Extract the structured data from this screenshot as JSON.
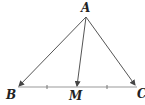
{
  "diagram": {
    "type": "triangle-with-median",
    "points": {
      "A": {
        "label": "A",
        "x": 86,
        "y": 17
      },
      "B": {
        "label": "B",
        "x": 18,
        "y": 87
      },
      "C": {
        "label": "C",
        "x": 137,
        "y": 87
      },
      "M": {
        "label": "M",
        "x": 77,
        "y": 87
      }
    },
    "segments": [
      {
        "from": "A",
        "to": "B",
        "arrow": true
      },
      {
        "from": "A",
        "to": "M",
        "arrow": true
      },
      {
        "from": "A",
        "to": "C",
        "arrow": true
      },
      {
        "from": "B",
        "to": "C",
        "arrow": false
      }
    ],
    "equal_marks": [
      "BM",
      "MC"
    ],
    "colors": {
      "stroke": "#555555",
      "bc_line": "#888888",
      "label": "#222222"
    }
  }
}
